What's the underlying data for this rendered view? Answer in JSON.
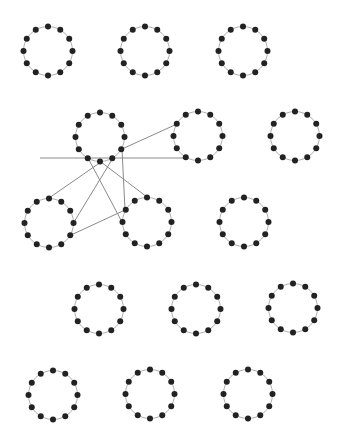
{
  "canvas": {
    "width": 340,
    "height": 443,
    "background": "#ffffff"
  },
  "style": {
    "ring_stroke": "#b0b0b0",
    "ring_stroke_width": 1,
    "node_fill": "#222222",
    "node_radius": 3,
    "edge_stroke": "#8a8a8a",
    "edge_stroke_width": 1
  },
  "ring": {
    "radius": 24.5,
    "nodes_per_ring": 12
  },
  "rings": [
    {
      "id": "r1c1",
      "cx": 48,
      "cy": 51
    },
    {
      "id": "r1c2",
      "cx": 145,
      "cy": 51
    },
    {
      "id": "r1c3",
      "cx": 243,
      "cy": 51
    },
    {
      "id": "r2c1",
      "cx": 100,
      "cy": 137
    },
    {
      "id": "r2c2",
      "cx": 198,
      "cy": 136
    },
    {
      "id": "r2c3",
      "cx": 295,
      "cy": 136
    },
    {
      "id": "r3c1",
      "cx": 49,
      "cy": 223
    },
    {
      "id": "r3c2",
      "cx": 147,
      "cy": 222
    },
    {
      "id": "r3c3",
      "cx": 244,
      "cy": 222
    },
    {
      "id": "r4c1",
      "cx": 99,
      "cy": 309
    },
    {
      "id": "r4c2",
      "cx": 196,
      "cy": 309
    },
    {
      "id": "r4c3",
      "cx": 293,
      "cy": 308
    },
    {
      "id": "r5c1",
      "cx": 53,
      "cy": 395
    },
    {
      "id": "r5c2",
      "cx": 150,
      "cy": 394
    },
    {
      "id": "r5c3",
      "cx": 248,
      "cy": 394
    }
  ],
  "edges": [
    {
      "id": "e-horizontal",
      "x1": 40,
      "y1": 158,
      "x2": 185,
      "y2": 158
    },
    {
      "id": "e-tl4-to-tr10",
      "x1": 122,
      "y1": 149,
      "x2": 177,
      "y2": 124
    },
    {
      "id": "e-tl4-to-mid10",
      "x1": 122,
      "y1": 149,
      "x2": 125,
      "y2": 210
    },
    {
      "id": "e-tl6-to-left12",
      "x1": 101,
      "y1": 162,
      "x2": 49,
      "y2": 198
    },
    {
      "id": "e-tl6-to-mid12",
      "x1": 101,
      "y1": 162,
      "x2": 147,
      "y2": 197
    },
    {
      "id": "e-tl5-to-left3",
      "x1": 113,
      "y1": 158,
      "x2": 74,
      "y2": 222
    },
    {
      "id": "e-tl7-to-mid9",
      "x1": 88,
      "y1": 158,
      "x2": 122,
      "y2": 222
    },
    {
      "id": "e-left4-to-mid10",
      "x1": 71,
      "y1": 235,
      "x2": 125,
      "y2": 210
    }
  ]
}
